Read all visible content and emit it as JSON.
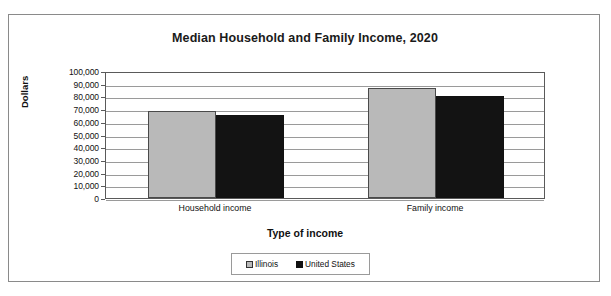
{
  "chart_data": {
    "type": "bar",
    "title": "Median Household and Family Income, 2020",
    "xlabel": "Type of income",
    "ylabel": "Dollars",
    "categories": [
      "Household income",
      "Family income"
    ],
    "series": [
      {
        "name": "Illinois",
        "color": "#b9b9b9",
        "values": [
          68400,
          86300
        ]
      },
      {
        "name": "United States",
        "color": "#111111",
        "values": [
          65000,
          80100
        ]
      }
    ],
    "ylim": [
      0,
      100000
    ],
    "ytick_step": 10000,
    "ytick_labels": [
      "100,000",
      "90,000",
      "80,000",
      "70,000",
      "60,000",
      "50,000",
      "40,000",
      "30,000",
      "20,000",
      "10,000",
      "0"
    ],
    "grid": true,
    "legend_position": "bottom"
  },
  "legend": {
    "items": [
      {
        "label": "Illinois"
      },
      {
        "label": "United States"
      }
    ]
  }
}
